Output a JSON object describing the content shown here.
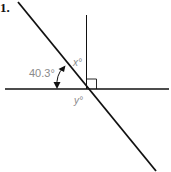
{
  "problem": {
    "number": "1."
  },
  "diagram": {
    "given_angle_label": "40.3°",
    "unknown_angle_x_label": "x°",
    "unknown_angle_y_label": "y°",
    "right_angle_marker": true,
    "line_color": "#111111",
    "label_color": "#8a8a8a"
  }
}
